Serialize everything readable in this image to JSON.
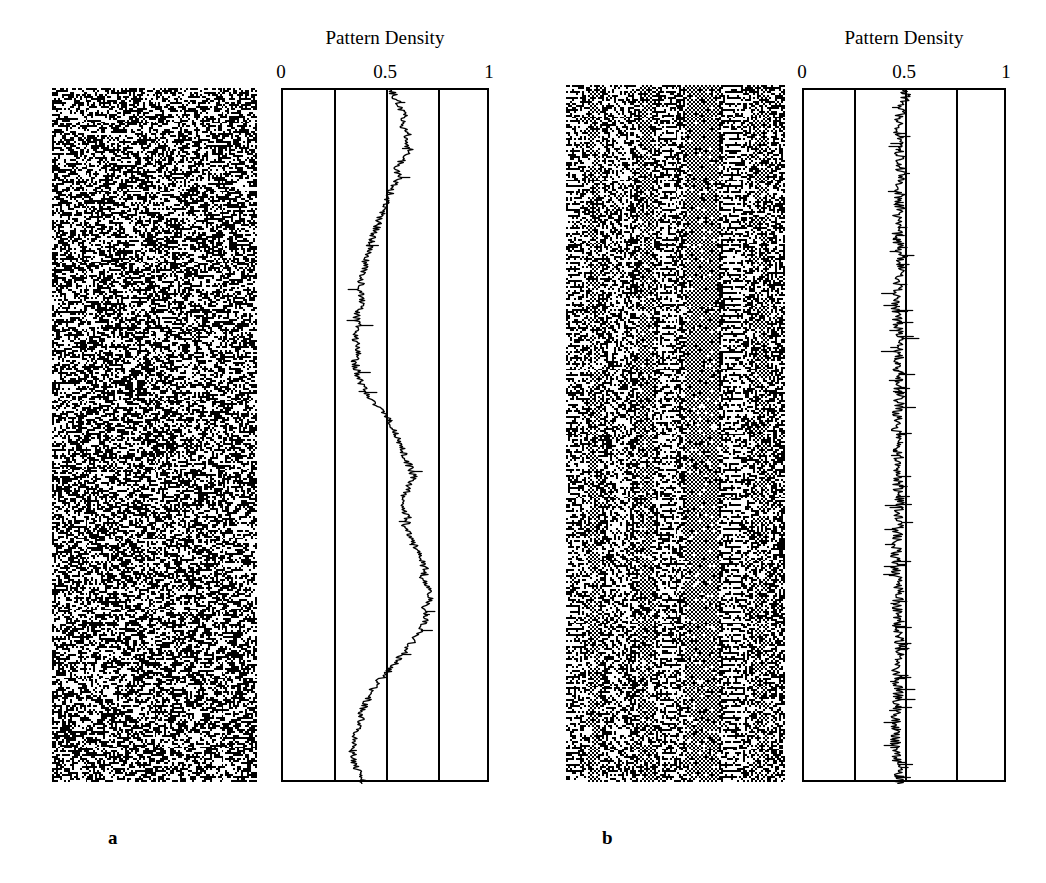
{
  "figure": {
    "background": "#ffffff",
    "ink": "#000000",
    "panels": [
      {
        "id": "a",
        "label": "a",
        "label_x": 108,
        "label_y": 828,
        "pattern": {
          "name": "random-pattern-a",
          "x": 52,
          "y": 88,
          "width": 205,
          "height": 694,
          "cols": 104,
          "rows": 352,
          "kind": "random",
          "seed": 20117,
          "fill": 0.5,
          "description": "class-3 chaotic cellular automaton space-time pattern, uniform random texture"
        },
        "plot": {
          "name": "density-plot-a",
          "x": 281,
          "y": 88,
          "width": 208,
          "height": 694,
          "title": "Pattern Density",
          "title_y": 42,
          "ticks": [
            {
              "label": "0",
              "value": 0
            },
            {
              "label": "0.5",
              "value": 0.5
            },
            {
              "label": "1",
              "value": 1
            }
          ],
          "gridlines": [
            0.25,
            0.5,
            0.75
          ],
          "xlim": [
            0,
            1
          ],
          "trace": {
            "name": "density-trace-a",
            "seed": 9143,
            "noise": 0.018,
            "spike_rate": 0.035,
            "spike_amp": 0.055,
            "knots": [
              [
                0.0,
                0.52
              ],
              [
                0.012,
                0.545
              ],
              [
                0.025,
                0.56
              ],
              [
                0.038,
                0.59
              ],
              [
                0.05,
                0.572
              ],
              [
                0.062,
                0.6
              ],
              [
                0.075,
                0.588
              ],
              [
                0.088,
                0.612
              ],
              [
                0.1,
                0.575
              ],
              [
                0.112,
                0.545
              ],
              [
                0.125,
                0.56
              ],
              [
                0.138,
                0.528
              ],
              [
                0.15,
                0.512
              ],
              [
                0.165,
                0.498
              ],
              [
                0.18,
                0.472
              ],
              [
                0.195,
                0.455
              ],
              [
                0.21,
                0.432
              ],
              [
                0.225,
                0.418
              ],
              [
                0.24,
                0.402
              ],
              [
                0.255,
                0.392
              ],
              [
                0.27,
                0.378
              ],
              [
                0.285,
                0.372
              ],
              [
                0.3,
                0.382
              ],
              [
                0.315,
                0.368
              ],
              [
                0.33,
                0.352
              ],
              [
                0.345,
                0.362
              ],
              [
                0.36,
                0.348
              ],
              [
                0.375,
                0.36
              ],
              [
                0.39,
                0.345
              ],
              [
                0.405,
                0.355
              ],
              [
                0.42,
                0.372
              ],
              [
                0.435,
                0.395
              ],
              [
                0.448,
                0.43
              ],
              [
                0.46,
                0.468
              ],
              [
                0.472,
                0.498
              ],
              [
                0.482,
                0.522
              ],
              [
                0.492,
                0.54
              ],
              [
                0.505,
                0.558
              ],
              [
                0.518,
                0.572
              ],
              [
                0.53,
                0.588
              ],
              [
                0.545,
                0.612
              ],
              [
                0.558,
                0.628
              ],
              [
                0.57,
                0.608
              ],
              [
                0.582,
                0.588
              ],
              [
                0.594,
                0.565
              ],
              [
                0.606,
                0.58
              ],
              [
                0.618,
                0.602
              ],
              [
                0.63,
                0.585
              ],
              [
                0.642,
                0.606
              ],
              [
                0.655,
                0.628
              ],
              [
                0.668,
                0.648
              ],
              [
                0.68,
                0.665
              ],
              [
                0.692,
                0.688
              ],
              [
                0.704,
                0.672
              ],
              [
                0.716,
                0.692
              ],
              [
                0.728,
                0.712
              ],
              [
                0.74,
                0.695
              ],
              [
                0.752,
                0.672
              ],
              [
                0.764,
                0.688
              ],
              [
                0.776,
                0.668
              ],
              [
                0.788,
                0.642
              ],
              [
                0.8,
                0.612
              ],
              [
                0.812,
                0.578
              ],
              [
                0.824,
                0.545
              ],
              [
                0.836,
                0.512
              ],
              [
                0.848,
                0.472
              ],
              [
                0.86,
                0.442
              ],
              [
                0.872,
                0.418
              ],
              [
                0.884,
                0.398
              ],
              [
                0.896,
                0.382
              ],
              [
                0.908,
                0.372
              ],
              [
                0.92,
                0.36
              ],
              [
                0.932,
                0.348
              ],
              [
                0.944,
                0.34
              ],
              [
                0.956,
                0.335
              ],
              [
                0.968,
                0.342
              ],
              [
                0.978,
                0.355
              ],
              [
                0.988,
                0.372
              ],
              [
                1.0,
                0.39
              ]
            ]
          }
        }
      },
      {
        "id": "b",
        "label": "b",
        "label_x": 602,
        "label_y": 828,
        "pattern": {
          "name": "structured-pattern-b",
          "x": 566,
          "y": 85,
          "width": 219,
          "height": 697,
          "cols": 110,
          "rows": 354,
          "kind": "structured",
          "seed": 48231,
          "fill": 0.5,
          "description": "class-4 complex cellular automaton space-time pattern with persistent vertical striped domains",
          "stripe_bands": [
            {
              "start": 0.0,
              "end": 0.07,
              "period": 3,
              "strength": 0.55
            },
            {
              "start": 0.1,
              "end": 0.16,
              "period": 2,
              "strength": 0.7
            },
            {
              "start": 0.2,
              "end": 0.27,
              "period": 4,
              "strength": 0.45
            },
            {
              "start": 0.33,
              "end": 0.4,
              "period": 2,
              "strength": 0.75
            },
            {
              "start": 0.44,
              "end": 0.5,
              "period": 3,
              "strength": 0.6
            },
            {
              "start": 0.55,
              "end": 0.7,
              "period": 2,
              "strength": 0.85
            },
            {
              "start": 0.72,
              "end": 0.8,
              "period": 3,
              "strength": 0.65
            },
            {
              "start": 0.86,
              "end": 0.93,
              "period": 2,
              "strength": 0.6
            }
          ]
        },
        "plot": {
          "name": "density-plot-b",
          "x": 802,
          "y": 88,
          "width": 204,
          "height": 694,
          "title": "Pattern Density",
          "title_y": 42,
          "ticks": [
            {
              "label": "0",
              "value": 0
            },
            {
              "label": "0.5",
              "value": 0.5
            },
            {
              "label": "1",
              "value": 1
            }
          ],
          "gridlines": [
            0.25,
            0.5,
            0.75
          ],
          "xlim": [
            0,
            1
          ],
          "trace": {
            "name": "density-trace-b",
            "seed": 3371,
            "noise": 0.026,
            "spike_rate": 0.16,
            "spike_amp": 0.075,
            "knots": [
              [
                0.0,
                0.5
              ],
              [
                0.04,
                0.47
              ],
              [
                0.08,
                0.462
              ],
              [
                0.12,
                0.478
              ],
              [
                0.16,
                0.468
              ],
              [
                0.2,
                0.455
              ],
              [
                0.24,
                0.472
              ],
              [
                0.28,
                0.462
              ],
              [
                0.32,
                0.45
              ],
              [
                0.36,
                0.468
              ],
              [
                0.4,
                0.458
              ],
              [
                0.44,
                0.47
              ],
              [
                0.48,
                0.452
              ],
              [
                0.52,
                0.465
              ],
              [
                0.56,
                0.455
              ],
              [
                0.6,
                0.472
              ],
              [
                0.64,
                0.458
              ],
              [
                0.68,
                0.448
              ],
              [
                0.72,
                0.465
              ],
              [
                0.76,
                0.455
              ],
              [
                0.8,
                0.47
              ],
              [
                0.84,
                0.452
              ],
              [
                0.88,
                0.462
              ],
              [
                0.92,
                0.448
              ],
              [
                0.96,
                0.455
              ],
              [
                1.0,
                0.468
              ]
            ]
          }
        }
      }
    ]
  },
  "chart_data": {
    "type": "line",
    "title": "Pattern Density",
    "xlabel": "Pattern Density",
    "ylabel": "Time step (downward)",
    "xlim": [
      0,
      1
    ],
    "xticks": [
      0,
      0.5,
      1
    ],
    "xticklabels": [
      "0",
      "0.5",
      "1"
    ],
    "gridlines": [
      0.25,
      0.5,
      0.75
    ],
    "grid": true,
    "legend": "none",
    "orientation": "vertical-time-axis",
    "series": [
      {
        "name": "a",
        "panel": "a",
        "description": "density of chaotic random pattern vs time; slow large-amplitude drift between 0.33 and 0.71",
        "mean": 0.5,
        "min": 0.33,
        "max": 0.71,
        "values": [
          0.52,
          0.545,
          0.56,
          0.59,
          0.572,
          0.6,
          0.588,
          0.612,
          0.575,
          0.545,
          0.56,
          0.528,
          0.512,
          0.498,
          0.472,
          0.455,
          0.432,
          0.418,
          0.402,
          0.392,
          0.378,
          0.372,
          0.382,
          0.368,
          0.352,
          0.362,
          0.348,
          0.36,
          0.345,
          0.355,
          0.372,
          0.395,
          0.43,
          0.468,
          0.498,
          0.522,
          0.54,
          0.558,
          0.572,
          0.588,
          0.612,
          0.628,
          0.608,
          0.588,
          0.565,
          0.58,
          0.602,
          0.585,
          0.606,
          0.628,
          0.648,
          0.665,
          0.688,
          0.672,
          0.692,
          0.712,
          0.695,
          0.672,
          0.688,
          0.668,
          0.642,
          0.612,
          0.578,
          0.545,
          0.512,
          0.472,
          0.442,
          0.418,
          0.398,
          0.382,
          0.372,
          0.36,
          0.348,
          0.34,
          0.335,
          0.342,
          0.355,
          0.372,
          0.39
        ]
      },
      {
        "name": "b",
        "panel": "b",
        "description": "density of structured pattern vs time; tightly fluctuating about 0.46 with frequent narrow spikes",
        "mean": 0.462,
        "min": 0.4,
        "max": 0.55,
        "values": [
          0.5,
          0.47,
          0.462,
          0.478,
          0.468,
          0.455,
          0.472,
          0.462,
          0.45,
          0.468,
          0.458,
          0.47,
          0.452,
          0.465,
          0.455,
          0.472,
          0.458,
          0.448,
          0.465,
          0.455,
          0.47,
          0.452,
          0.462,
          0.448,
          0.455,
          0.468
        ]
      }
    ]
  }
}
